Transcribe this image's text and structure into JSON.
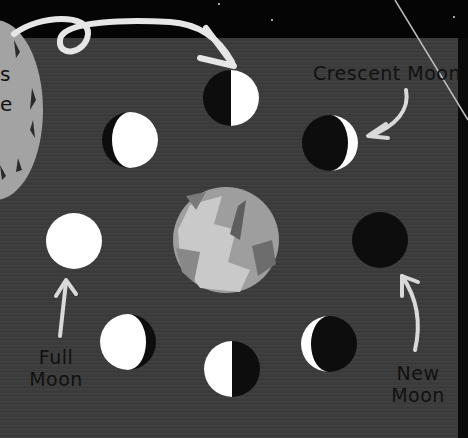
{
  "diagram": {
    "labels": {
      "crescent": "Crescent Moon",
      "full_line1": "Full",
      "full_line2": "Moon",
      "new_line1": "New",
      "new_line2": "Moon"
    },
    "partial_text": {
      "line1": "s",
      "line2": "e"
    },
    "colors": {
      "sky": "#050505",
      "board": "#3b3b3b",
      "moon_light": "#ffffff",
      "moon_dark": "#0d0d0d",
      "earth": "#a8a8a8",
      "big_moon": "#a3a3a3",
      "arrow": "#e6e6e6",
      "text": "#111111"
    },
    "moons": [
      {
        "position": "top",
        "phase": "first-quarter"
      },
      {
        "position": "top-right",
        "phase": "waxing-crescent"
      },
      {
        "position": "right",
        "phase": "new-moon"
      },
      {
        "position": "bottom-right",
        "phase": "waning-crescent"
      },
      {
        "position": "bottom",
        "phase": "last-quarter"
      },
      {
        "position": "bottom-left",
        "phase": "waning-gibbous"
      },
      {
        "position": "left",
        "phase": "full-moon"
      },
      {
        "position": "top-left",
        "phase": "waxing-gibbous"
      }
    ]
  }
}
